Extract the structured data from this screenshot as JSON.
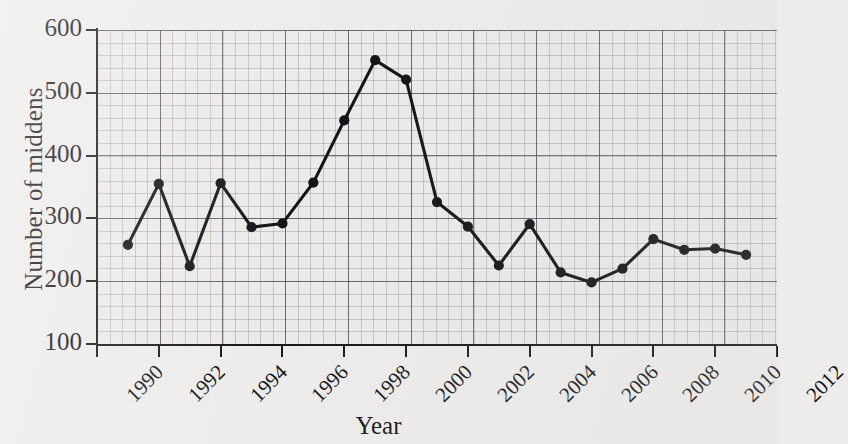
{
  "chart_data": {
    "type": "line",
    "title": "",
    "xlabel": "Year",
    "ylabel": "Number of middens",
    "xlim": [
      1990,
      2012
    ],
    "ylim": [
      100,
      600
    ],
    "grid": true,
    "grid_style": "graph-paper, minor every 20 units, major every 100 units",
    "legend": "none",
    "marker": "filled circle",
    "line_color": "#121316",
    "x": [
      1991,
      1992,
      1993,
      1994,
      1995,
      1996,
      1997,
      1998,
      1999,
      2000,
      2001,
      2002,
      2003,
      2004,
      2005,
      2006,
      2007,
      2008,
      2009,
      2010,
      2011
    ],
    "values": [
      258,
      355,
      224,
      356,
      286,
      292,
      357,
      456,
      552,
      521,
      326,
      287,
      225,
      291,
      214,
      198,
      220,
      267,
      250,
      252,
      242
    ],
    "xticks": [
      1990,
      1992,
      1994,
      1996,
      1998,
      2000,
      2002,
      2004,
      2006,
      2008,
      2010,
      2012
    ],
    "xtick_labels": [
      "1990",
      "1992",
      "1994",
      "1996",
      "1998",
      "2000",
      "2002",
      "2004",
      "2006",
      "2008",
      "2010",
      "2012"
    ],
    "yticks": [
      100,
      200,
      300,
      400,
      500,
      600
    ],
    "ytick_labels": [
      "100",
      "200",
      "300",
      "400",
      "500",
      "600"
    ]
  }
}
